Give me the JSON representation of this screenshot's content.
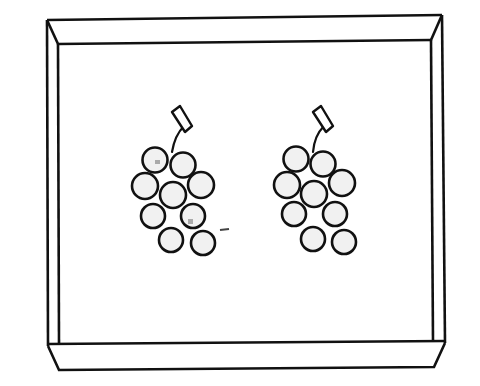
{
  "scene": {
    "title": "Tray with two bunches of grapes",
    "caption": "Two identical bunches of grapes on a tray",
    "colors": {
      "background": "#ffffff",
      "line": "#111111",
      "grape_fill": "#f1f1f1"
    },
    "tray": {
      "label": "tray"
    },
    "bunches": [
      {
        "label": "grape-bunch-left",
        "grape_count": 9
      },
      {
        "label": "grape-bunch-right",
        "grape_count": 9
      }
    ]
  }
}
